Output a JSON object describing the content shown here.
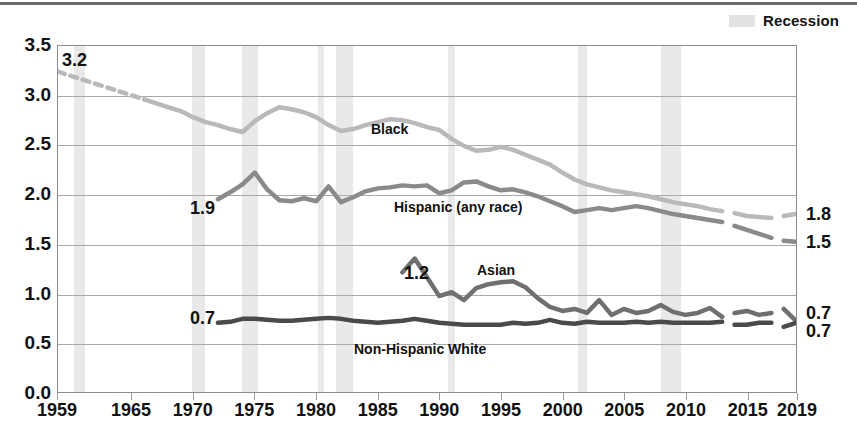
{
  "legend": {
    "recession_label": "Recession",
    "recession_color": "#e2e2e2"
  },
  "axis": {
    "y_ticks": [
      "0.0",
      "0.5",
      "1.0",
      "1.5",
      "2.0",
      "2.5",
      "3.0",
      "3.5"
    ],
    "x_ticks": [
      "1959",
      "1965",
      "1970",
      "1975",
      "1980",
      "1985",
      "1990",
      "1995",
      "2000",
      "2005",
      "2010",
      "2015",
      "2019"
    ]
  },
  "right_labels": [
    {
      "name": "black-end-value",
      "text": "1.8"
    },
    {
      "name": "hispanic-end-value",
      "text": "1.5"
    },
    {
      "name": "asian-end-value",
      "text": "0.7"
    },
    {
      "name": "white-end-value",
      "text": "0.7"
    }
  ],
  "annotations": [
    {
      "name": "black-start-value",
      "text": "3.2"
    },
    {
      "name": "hispanic-start-value",
      "text": "1.9"
    },
    {
      "name": "asian-start-value",
      "text": "1.2"
    },
    {
      "name": "white-start-value",
      "text": "0.7"
    }
  ],
  "series_labels": [
    {
      "name": "series-label-black",
      "text": "Black"
    },
    {
      "name": "series-label-hispanic",
      "text": "Hispanic (any race)"
    },
    {
      "name": "series-label-asian",
      "text": "Asian"
    },
    {
      "name": "series-label-white",
      "text": "Non-Hispanic White"
    }
  ],
  "chart_data": {
    "type": "line",
    "title": "",
    "xlabel": "",
    "ylabel": "",
    "xlim": [
      1959,
      2019
    ],
    "ylim": [
      0.0,
      3.5
    ],
    "grid": true,
    "legend_position": "top-right",
    "colors": {
      "black": "#b9b9b9",
      "hispanic": "#8a8a8a",
      "asian": "#6f6f6f",
      "white": "#4a4a4a",
      "recession_band": "#e9e9e9",
      "gridline": "#a9a9a9",
      "axis": "#8c8c8c"
    },
    "recessions": [
      [
        1960.3,
        1961.2
      ],
      [
        1969.9,
        1970.9
      ],
      [
        1973.9,
        1975.2
      ],
      [
        1980.1,
        1980.6
      ],
      [
        1981.5,
        1982.9
      ],
      [
        1990.6,
        1991.2
      ],
      [
        2001.2,
        2001.9
      ],
      [
        2007.9,
        2009.5
      ]
    ],
    "series": [
      {
        "name": "Black",
        "key": "black",
        "color": "#b9b9b9",
        "start_value": 3.2,
        "end_value": 1.8,
        "x": [
          1959,
          1960,
          1961,
          1962,
          1963,
          1964,
          1965,
          1966,
          1967,
          1968,
          1969,
          1970,
          1971,
          1972,
          1973,
          1974,
          1975,
          1976,
          1977,
          1978,
          1979,
          1980,
          1981,
          1982,
          1983,
          1984,
          1985,
          1986,
          1987,
          1988,
          1989,
          1990,
          1991,
          1992,
          1993,
          1994,
          1995,
          1996,
          1997,
          1998,
          1999,
          2000,
          2001,
          2002,
          2003,
          2004,
          2005,
          2006,
          2007,
          2008,
          2009,
          2010,
          2011,
          2012,
          2013,
          2014,
          2015,
          2016,
          2017,
          2018,
          2019
        ],
        "values": [
          3.24,
          3.2,
          3.16,
          3.12,
          3.08,
          3.04,
          3.0,
          2.96,
          2.92,
          2.88,
          2.84,
          2.78,
          2.73,
          2.7,
          2.66,
          2.63,
          2.74,
          2.82,
          2.88,
          2.86,
          2.83,
          2.78,
          2.7,
          2.64,
          2.66,
          2.7,
          2.73,
          2.76,
          2.75,
          2.72,
          2.68,
          2.65,
          2.56,
          2.49,
          2.44,
          2.45,
          2.48,
          2.45,
          2.4,
          2.35,
          2.3,
          2.22,
          2.15,
          2.1,
          2.07,
          2.04,
          2.02,
          2.0,
          1.98,
          1.95,
          1.92,
          1.9,
          1.88,
          1.85,
          1.83,
          1.81,
          1.78,
          1.77,
          1.76,
          1.78,
          1.8
        ],
        "dashed_start_end": [
          1959,
          1965
        ],
        "gap_segments": [
          [
            2013,
            2014
          ],
          [
            2017,
            2018
          ]
        ]
      },
      {
        "name": "Hispanic (any race)",
        "key": "hispanic",
        "color": "#8a8a8a",
        "start_value": 1.9,
        "end_value": 1.5,
        "x": [
          1972,
          1973,
          1974,
          1975,
          1976,
          1977,
          1978,
          1979,
          1980,
          1981,
          1982,
          1983,
          1984,
          1985,
          1986,
          1987,
          1988,
          1989,
          1990,
          1991,
          1992,
          1993,
          1994,
          1995,
          1996,
          1997,
          1998,
          1999,
          2000,
          2001,
          2002,
          2003,
          2004,
          2005,
          2006,
          2007,
          2008,
          2009,
          2010,
          2011,
          2012,
          2013,
          2014,
          2015,
          2016,
          2017,
          2018,
          2019
        ],
        "values": [
          1.95,
          2.02,
          2.1,
          2.22,
          2.05,
          1.94,
          1.93,
          1.96,
          1.93,
          2.08,
          1.92,
          1.97,
          2.03,
          2.06,
          2.07,
          2.09,
          2.08,
          2.09,
          2.01,
          2.04,
          2.12,
          2.13,
          2.08,
          2.04,
          2.05,
          2.02,
          1.98,
          1.93,
          1.88,
          1.82,
          1.84,
          1.86,
          1.84,
          1.86,
          1.88,
          1.86,
          1.83,
          1.8,
          1.78,
          1.76,
          1.74,
          1.72,
          1.68,
          1.64,
          1.6,
          1.56,
          1.53,
          1.52
        ],
        "gap_segments": [
          [
            2013,
            2014
          ],
          [
            2017,
            2018
          ]
        ]
      },
      {
        "name": "Asian",
        "key": "asian",
        "color": "#6f6f6f",
        "start_value": 1.2,
        "end_value": 0.7,
        "x": [
          1987,
          1988,
          1989,
          1990,
          1991,
          1992,
          1993,
          1994,
          1995,
          1996,
          1997,
          1998,
          1999,
          2000,
          2001,
          2002,
          2003,
          2004,
          2005,
          2006,
          2007,
          2008,
          2009,
          2010,
          2011,
          2012,
          2013,
          2014,
          2015,
          2016,
          2017,
          2018,
          2019
        ],
        "values": [
          1.21,
          1.35,
          1.16,
          0.97,
          1.01,
          0.93,
          1.05,
          1.09,
          1.11,
          1.12,
          1.06,
          0.95,
          0.86,
          0.82,
          0.84,
          0.8,
          0.93,
          0.78,
          0.84,
          0.8,
          0.82,
          0.88,
          0.81,
          0.78,
          0.8,
          0.85,
          0.76,
          0.8,
          0.82,
          0.78,
          0.8,
          0.84,
          0.72
        ],
        "gap_segments": [
          [
            2013,
            2014
          ],
          [
            2017,
            2018
          ]
        ]
      },
      {
        "name": "Non-Hispanic White",
        "key": "white",
        "color": "#4a4a4a",
        "start_value": 0.7,
        "end_value": 0.7,
        "x": [
          1972,
          1973,
          1974,
          1975,
          1976,
          1977,
          1978,
          1979,
          1980,
          1981,
          1982,
          1983,
          1984,
          1985,
          1986,
          1987,
          1988,
          1989,
          1990,
          1991,
          1992,
          1993,
          1994,
          1995,
          1996,
          1997,
          1998,
          1999,
          2000,
          2001,
          2002,
          2003,
          2004,
          2005,
          2006,
          2007,
          2008,
          2009,
          2010,
          2011,
          2012,
          2013,
          2014,
          2015,
          2016,
          2017,
          2018,
          2019
        ],
        "values": [
          0.7,
          0.71,
          0.74,
          0.74,
          0.73,
          0.72,
          0.72,
          0.73,
          0.74,
          0.75,
          0.74,
          0.72,
          0.71,
          0.7,
          0.71,
          0.72,
          0.74,
          0.72,
          0.7,
          0.69,
          0.68,
          0.68,
          0.68,
          0.68,
          0.7,
          0.69,
          0.7,
          0.73,
          0.7,
          0.69,
          0.71,
          0.7,
          0.7,
          0.7,
          0.71,
          0.7,
          0.71,
          0.7,
          0.7,
          0.7,
          0.7,
          0.71,
          0.68,
          0.68,
          0.7,
          0.7,
          0.66,
          0.7
        ],
        "gap_segments": [
          [
            2013,
            2014
          ],
          [
            2017,
            2018
          ]
        ]
      }
    ]
  }
}
